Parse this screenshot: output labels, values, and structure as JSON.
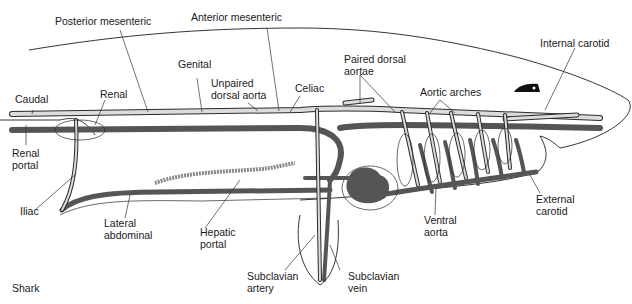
{
  "figure": {
    "caption": "Shark",
    "colors": {
      "background": "#ffffff",
      "vein": "#555555",
      "artery_fill": "#dcdcdc",
      "outline": "#1e1e1e",
      "label_text": "#1a1a1a"
    }
  },
  "labels": {
    "posterior_mesenteric": "Posterior mesenteric",
    "anterior_mesenteric": "Anterior mesenteric",
    "internal_carotid": "Internal carotid",
    "genital": "Genital",
    "paired_dorsal_aortae": "Paired dorsal\naortae",
    "unpaired_dorsal_aorta": "Unpaired\ndorsal aorta",
    "celiac": "Celiac",
    "aortic_arches": "Aortic arches",
    "caudal": "Caudal",
    "renal": "Renal",
    "renal_portal": "Renal\nportal",
    "iliac": "Iliac",
    "lateral_abdominal": "Lateral\nabdominal",
    "hepatic_portal": "Hepatic\nportal",
    "ventral_aorta": "Ventral\naorta",
    "external_carotid": "External\ncarotid",
    "subclavian_artery": "Subclavian\nartery",
    "subclavian_vein": "Subclavian\nvein",
    "shark": "Shark"
  }
}
